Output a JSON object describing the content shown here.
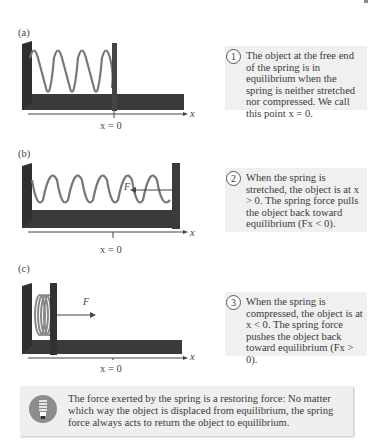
{
  "panels": [
    {
      "label": "(a)",
      "x_label": "x = 0",
      "axis": "x",
      "callout_number": "1",
      "callout_text": "The object at the free end of the spring is in equilibrium when the spring is neither stretched nor compressed. We call this point x = 0."
    },
    {
      "label": "(b)",
      "x_label": "x = 0",
      "axis": "x",
      "force_label": "F",
      "callout_number": "2",
      "callout_text": "When the spring is stretched, the object is at x > 0. The spring force pulls the object back toward equilibrium (Fx < 0)."
    },
    {
      "label": "(c)",
      "x_label": "x = 0",
      "axis": "x",
      "force_label": "F",
      "callout_number": "3",
      "callout_text": "When the spring is compressed, the object is at x < 0. The spring force pushes the object back toward equilibrium (Fx > 0)."
    }
  ],
  "note": {
    "icon": "lightbulb-icon",
    "text": "The force exerted by the spring is a restoring force: No matter which way the object is displaced from equilibrium, the spring force always acts to return the object to equilibrium."
  },
  "colors": {
    "apparatus": "#3a3a3a",
    "callout_bg": "#f0f0f0",
    "note_bg": "#efefef",
    "icon_circle": "#8d8d8d"
  }
}
